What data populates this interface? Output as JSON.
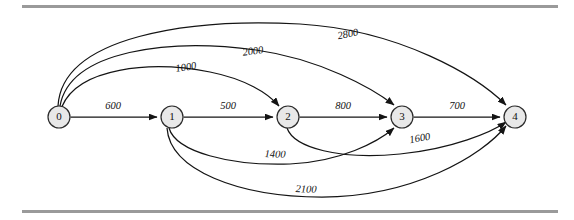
{
  "figure": {
    "title": "",
    "background_color": "#ffffff",
    "rule_color": "#9a9a9a",
    "node_fill": "#e8e8e8",
    "node_stroke": "#2b2b2b",
    "edge_color": "#141414"
  },
  "chart_data": {
    "type": "diagram",
    "diagram_kind": "directed-weighted-graph",
    "title": "",
    "xlabel": "",
    "ylabel": "",
    "legend": [],
    "grid": false,
    "nodes": [
      {
        "id": "0",
        "label": "0",
        "x": 59,
        "y": 117,
        "r": 11
      },
      {
        "id": "1",
        "label": "1",
        "x": 172,
        "y": 117,
        "r": 11
      },
      {
        "id": "2",
        "label": "2",
        "x": 288,
        "y": 117,
        "r": 11
      },
      {
        "id": "3",
        "label": "3",
        "x": 402,
        "y": 117,
        "r": 11
      },
      {
        "id": "4",
        "label": "4",
        "x": 515,
        "y": 117,
        "r": 11
      }
    ],
    "edges": [
      {
        "from": "0",
        "to": "1",
        "weight": 600,
        "label": "600",
        "shape": "straight",
        "path": "M 70.5 117 L 157 117",
        "label_x": 113,
        "label_y": 107
      },
      {
        "from": "1",
        "to": "2",
        "weight": 500,
        "label": "500",
        "shape": "straight",
        "path": "M 183.5 117 L 273 117",
        "label_x": 228,
        "label_y": 107
      },
      {
        "from": "2",
        "to": "3",
        "weight": 800,
        "label": "800",
        "shape": "straight",
        "path": "M 299.5 117 L 387 117",
        "label_x": 343,
        "label_y": 107
      },
      {
        "from": "3",
        "to": "4",
        "weight": 700,
        "label": "700",
        "shape": "straight",
        "path": "M 413.5 117 L 500 117",
        "label_x": 457,
        "label_y": 107
      },
      {
        "from": "0",
        "to": "2",
        "weight": 1000,
        "label": "1000",
        "shape": "arc-above",
        "path": "M 62 106.5 C 78 68, 150 60, 210 72 C 245 79, 268 93, 279 106",
        "label_x": 186,
        "label_y": 68,
        "label_rotate": -9
      },
      {
        "from": "0",
        "to": "3",
        "weight": 2000,
        "label": "2000",
        "shape": "arc-above",
        "path": "M 60 106 C 70 50, 170 38, 256 50 C 320 59, 372 88, 394 105",
        "label_x": 253,
        "label_y": 52,
        "label_rotate": -8
      },
      {
        "from": "0",
        "to": "4",
        "weight": 2800,
        "label": "2800",
        "shape": "arc-above",
        "path": "M 58 106 C 62 36, 190 18, 300 24 C 400 30, 477 76, 506 105",
        "label_x": 348,
        "label_y": 35,
        "label_rotate": -11
      },
      {
        "from": "1",
        "to": "3",
        "weight": 1400,
        "label": "1400",
        "shape": "arc-below",
        "path": "M 169 128 C 176 152, 230 166, 290 164 C 340 162, 378 142, 394 128",
        "label_x": 275,
        "label_y": 155,
        "label_rotate": 2
      },
      {
        "from": "2",
        "to": "4",
        "weight": 1600,
        "label": "1600",
        "shape": "arc-below",
        "path": "M 287 128 C 294 148, 340 160, 400 154 C 452 149, 492 132, 506 122",
        "label_x": 420,
        "label_y": 139,
        "label_rotate": -10
      },
      {
        "from": "1",
        "to": "4",
        "weight": 2100,
        "label": "2100",
        "shape": "arc-below",
        "path": "M 167 128 C 170 170, 238 197, 322 197 C 412 197, 482 156, 506 126",
        "label_x": 306,
        "label_y": 190,
        "label_rotate": 2
      }
    ]
  },
  "rules": [
    {
      "name": "top-rule",
      "y": 5
    },
    {
      "name": "bottom-rule",
      "y": 210
    }
  ]
}
